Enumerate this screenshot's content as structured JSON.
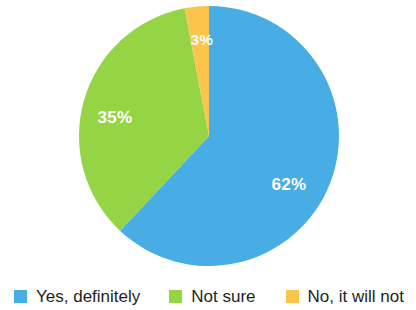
{
  "chart_data": {
    "type": "pie",
    "title": "",
    "subtitle": "",
    "xlabel": "",
    "ylabel": "",
    "legend_position": "bottom",
    "grid": false,
    "start_angle_deg": 0,
    "direction": "clockwise",
    "categories": [
      "Yes, definitely",
      "Not sure",
      "No, it will not"
    ],
    "values": [
      62,
      35,
      3
    ],
    "value_unit": "%",
    "data_labels": [
      "62%",
      "35%",
      "3%"
    ],
    "colors": [
      "#47ADE4",
      "#95D545",
      "#FBC54B"
    ],
    "slices": [
      {
        "label": "Yes, definitely",
        "value": 62,
        "data_label": "62%",
        "color": "#47ADE4",
        "start_deg": 0,
        "end_deg": 223.2,
        "label_x": 289,
        "label_y": 186
      },
      {
        "label": "Not sure",
        "value": 35,
        "data_label": "35%",
        "color": "#95D545",
        "start_deg": 223.2,
        "end_deg": 349.2,
        "label_x": 115,
        "label_y": 119
      },
      {
        "label": "No, it will not",
        "value": 3,
        "data_label": "3%",
        "color": "#FBC54B",
        "start_deg": 349.2,
        "end_deg": 360,
        "label_x": 202,
        "label_y": 41
      }
    ],
    "geometry": {
      "center_x": 209,
      "center_y": 136,
      "radius": 130
    }
  },
  "legend": {
    "items": [
      {
        "label": "Yes, definitely",
        "color": "#47ADE4"
      },
      {
        "label": "Not sure",
        "color": "#95D545"
      },
      {
        "label": "No, it will not",
        "color": "#FBC54B"
      }
    ]
  }
}
